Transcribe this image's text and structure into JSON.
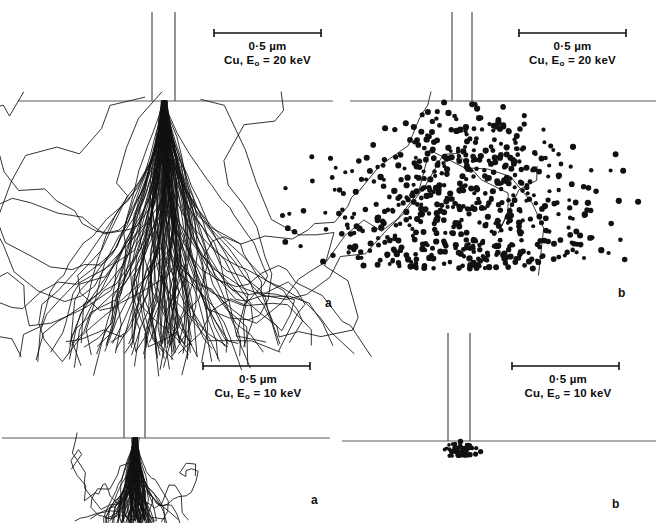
{
  "figure": {
    "type": "monte-carlo-electron-trajectory-simulation",
    "material": "Cu",
    "panels": [
      {
        "id": "top-left",
        "letter": "a",
        "content": "electron-trajectories",
        "scale_bar_label": "0·5 µm",
        "condition_prefix": "Cu, E",
        "condition_subscript": "o",
        "condition_suffix": " = 20 keV",
        "beam_energy_keV": 20,
        "scale_bar_length_um": 0.5
      },
      {
        "id": "top-right",
        "letter": "b",
        "content": "x-ray-generation-sites",
        "scale_bar_label": "0·5 µm",
        "condition_prefix": "Cu, E",
        "condition_subscript": "o",
        "condition_suffix": " = 20 keV",
        "beam_energy_keV": 20,
        "scale_bar_length_um": 0.5
      },
      {
        "id": "bottom-left",
        "letter": "a",
        "content": "electron-trajectories",
        "scale_bar_label": "0·5 µm",
        "condition_prefix": "Cu, E",
        "condition_subscript": "o",
        "condition_suffix": " = 10 keV",
        "beam_energy_keV": 10,
        "scale_bar_length_um": 0.5
      },
      {
        "id": "bottom-right",
        "letter": "b",
        "content": "x-ray-generation-sites",
        "scale_bar_label": "0·5 µm",
        "condition_prefix": "Cu, E",
        "condition_subscript": "o",
        "condition_suffix": " = 10 keV",
        "beam_energy_keV": 10,
        "scale_bar_length_um": 0.5
      }
    ],
    "colors": {
      "ink": "#111111",
      "rule": "#5a5a5a",
      "background": "#ffffff"
    }
  },
  "chart_data": {
    "type": "scatter",
    "title": "",
    "xlabel": "",
    "ylabel": "",
    "panels": [
      {
        "panel": "a",
        "row": "top",
        "beam_energy_keV": 20,
        "material": "Cu",
        "scale_bar_um": 0.5,
        "render": "trajectories",
        "n_trajectories": 120,
        "interaction_depth_um": 1.05,
        "interaction_width_um": 1.5,
        "seed": 11
      },
      {
        "panel": "b",
        "row": "top",
        "beam_energy_keV": 20,
        "material": "Cu",
        "scale_bar_um": 0.5,
        "render": "dots",
        "n_dots": 620,
        "interaction_depth_um": 0.95,
        "interaction_width_um": 1.2,
        "seed": 27
      },
      {
        "panel": "a",
        "row": "bottom",
        "beam_energy_keV": 10,
        "material": "Cu",
        "scale_bar_um": 0.5,
        "render": "trajectories",
        "n_trajectories": 90,
        "interaction_depth_um": 0.33,
        "interaction_width_um": 0.42,
        "seed": 5
      },
      {
        "panel": "b",
        "row": "bottom",
        "beam_energy_keV": 10,
        "material": "Cu",
        "scale_bar_um": 0.5,
        "render": "dots",
        "n_dots": 60,
        "interaction_depth_um": 0.09,
        "interaction_width_um": 0.12,
        "seed": 42
      }
    ]
  }
}
